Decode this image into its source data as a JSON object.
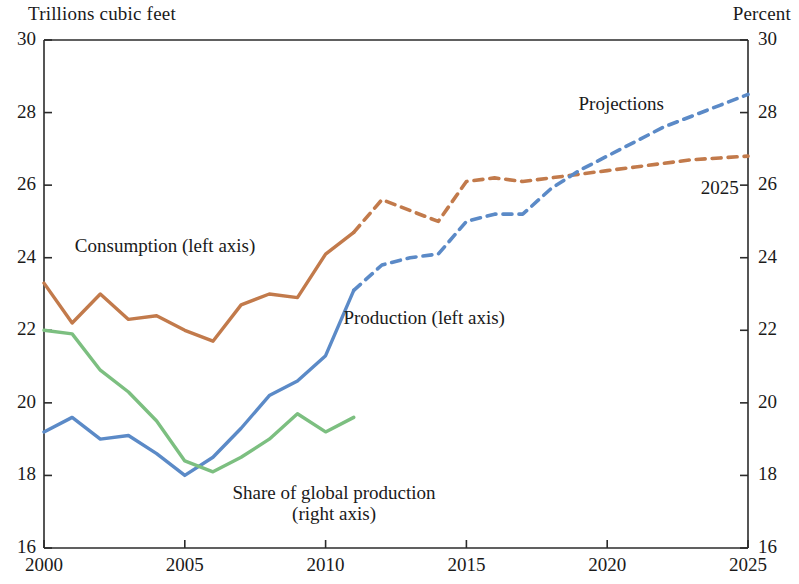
{
  "chart_data": {
    "type": "line",
    "title": "",
    "left_axis_title": "Trillions cubic feet",
    "right_axis_title": "Percent",
    "xlabel": "",
    "ylabel": "Trillions cubic feet",
    "y2label": "Percent",
    "xlim": [
      2000,
      2025
    ],
    "ylim": [
      16,
      30
    ],
    "y2lim": [
      16,
      30
    ],
    "xticks": [
      "2000",
      "2005",
      "2010",
      "2015",
      "2020",
      "2025"
    ],
    "xtick_values": [
      2000,
      2005,
      2010,
      2015,
      2020,
      2025
    ],
    "yticks": [
      "16",
      "18",
      "20",
      "22",
      "24",
      "26",
      "28",
      "30"
    ],
    "ytick_values": [
      16,
      18,
      20,
      22,
      24,
      26,
      28,
      30
    ],
    "y2ticks": [
      "16",
      "18",
      "20",
      "22",
      "24",
      "26",
      "28",
      "30"
    ],
    "y2tick_values": [
      16,
      18,
      20,
      22,
      24,
      26,
      28,
      30
    ],
    "grid": false,
    "legend_position": "inline-annotations",
    "series": [
      {
        "name": "Consumption (left axis)",
        "axis": "left",
        "color": "#c27a4b",
        "history_style": "solid",
        "projection_style": "dashed",
        "projection_start_year": 2011,
        "x": [
          2000,
          2001,
          2002,
          2003,
          2004,
          2005,
          2006,
          2007,
          2008,
          2009,
          2010,
          2011,
          2012,
          2013,
          2014,
          2015,
          2016,
          2017,
          2018,
          2019,
          2020,
          2021,
          2022,
          2023,
          2024,
          2025
        ],
        "values": [
          23.3,
          22.2,
          23.0,
          22.3,
          22.4,
          22.0,
          21.7,
          22.7,
          23.0,
          22.9,
          24.1,
          24.7,
          25.6,
          25.3,
          25.0,
          26.1,
          26.2,
          26.1,
          26.2,
          26.3,
          26.4,
          26.5,
          26.6,
          26.7,
          26.75,
          26.8
        ]
      },
      {
        "name": "Production (left axis)",
        "axis": "left",
        "color": "#5b8ac7",
        "history_style": "solid",
        "projection_style": "dashed",
        "projection_start_year": 2011,
        "x": [
          2000,
          2001,
          2002,
          2003,
          2004,
          2005,
          2006,
          2007,
          2008,
          2009,
          2010,
          2011,
          2012,
          2013,
          2014,
          2015,
          2016,
          2017,
          2018,
          2019,
          2020,
          2021,
          2022,
          2023,
          2024,
          2025
        ],
        "values": [
          19.2,
          19.6,
          19.0,
          19.1,
          18.6,
          18.0,
          18.5,
          19.3,
          20.2,
          20.6,
          21.3,
          23.1,
          23.8,
          24.0,
          24.1,
          25.0,
          25.2,
          25.2,
          25.9,
          26.4,
          26.8,
          27.2,
          27.6,
          27.9,
          28.2,
          28.5
        ]
      },
      {
        "name": "Share of global production (right axis)",
        "axis": "right",
        "color": "#7cbf80",
        "history_style": "solid",
        "projection_style": "none",
        "projection_start_year": null,
        "x": [
          2000,
          2001,
          2002,
          2003,
          2004,
          2005,
          2006,
          2007,
          2008,
          2009,
          2010,
          2011
        ],
        "values": [
          22.0,
          21.9,
          20.9,
          20.3,
          19.5,
          18.4,
          18.1,
          18.5,
          19.0,
          19.7,
          19.2,
          19.6
        ]
      }
    ],
    "annotations": [
      {
        "text": "Consumption (left axis)",
        "x": 2004.3,
        "y": 24.3,
        "name": "consumption-label"
      },
      {
        "text": "Production (left axis)",
        "x": 2013.5,
        "y": 22.3,
        "name": "production-label"
      },
      {
        "text": "Share of global production",
        "x": 2010.3,
        "y": 17.5,
        "name": "share-label-line1"
      },
      {
        "text": "(right axis)",
        "x": 2010.3,
        "y": 16.9,
        "name": "share-label-line2"
      },
      {
        "text": "Projections",
        "x": 2020.5,
        "y": 28.2,
        "name": "projections-label"
      },
      {
        "text": "2025",
        "x": 2024.0,
        "y": 25.9,
        "name": "end-year-label"
      }
    ]
  }
}
